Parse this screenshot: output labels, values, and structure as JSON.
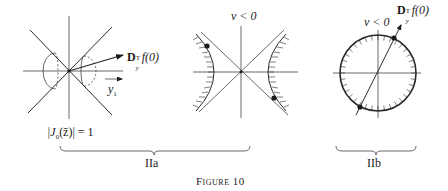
{
  "figure": {
    "caption": "Figure 10",
    "panels": {
      "left": {
        "arrow_label_main": "D",
        "arrow_label_sup": "T",
        "arrow_label_sub": "y",
        "arrow_label_rest": "f(0)",
        "axis_label": "y",
        "axis_label_sub": "1",
        "condition_label": "|J",
        "condition_sub": "0",
        "condition_rest": "(z̄)| = 1"
      },
      "middle": {
        "region_label": "v < 0"
      },
      "right": {
        "region_label": "v < 0",
        "arrow_label_main": "D",
        "arrow_label_sup": "T",
        "arrow_label_sub": "y",
        "arrow_label_rest": "f(0)"
      }
    },
    "braces": [
      {
        "label": "IIa"
      },
      {
        "label": "IIb"
      }
    ]
  }
}
